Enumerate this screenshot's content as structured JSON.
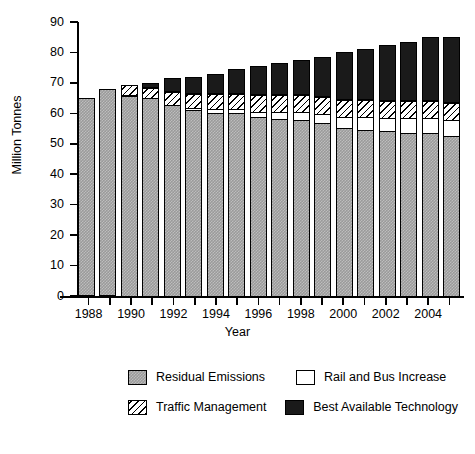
{
  "chart_data": {
    "type": "bar",
    "subtype": "stacked-bar",
    "title": "",
    "xlabel": "Year",
    "ylabel": "Million Tonnes",
    "ylim": [
      0,
      90
    ],
    "yticks": [
      0,
      10,
      20,
      30,
      40,
      50,
      60,
      70,
      80,
      90
    ],
    "ytick_labels": [
      "0",
      "10",
      "20",
      "30",
      "40",
      "50",
      "60",
      "70",
      "80",
      "90"
    ],
    "grid": false,
    "legend_position": "below-plot",
    "categories": [
      "1988",
      "1989",
      "1990",
      "1991",
      "1992",
      "1993",
      "1994",
      "1995",
      "1996",
      "1997",
      "1998",
      "1999",
      "2000",
      "2001",
      "2002",
      "2003",
      "2004",
      "2005"
    ],
    "xtick_labels": [
      "1988",
      "1990",
      "1992",
      "1994",
      "1996",
      "1998",
      "2000",
      "2002",
      "2004"
    ],
    "xtick_categories": [
      "1988",
      "1990",
      "1992",
      "1994",
      "1996",
      "1998",
      "2000",
      "2002",
      "2004"
    ],
    "series": [
      {
        "name": "Residual Emissions",
        "fill": "checkered-grey",
        "color": "#9a9a9a",
        "values": [
          65.0,
          68.0,
          66.0,
          65.5,
          63.0,
          61.5,
          60.5,
          60.5,
          59.0,
          58.5,
          58.0,
          57.0,
          55.5,
          55.0,
          54.5,
          54.0,
          54.0,
          53.0
        ]
      },
      {
        "name": "Rail and Bus Increase",
        "fill": "solid-white",
        "color": "#ffffff",
        "values": [
          0.0,
          0.0,
          0.0,
          0.0,
          0.5,
          1.0,
          1.5,
          1.5,
          2.0,
          2.5,
          3.0,
          3.5,
          4.0,
          4.5,
          4.5,
          5.0,
          5.0,
          5.5
        ]
      },
      {
        "name": "Traffic Management",
        "fill": "diagonal-hatch",
        "color": "#ffffff",
        "values": [
          0.0,
          0.0,
          3.5,
          3.5,
          4.5,
          5.0,
          5.5,
          5.5,
          6.0,
          6.0,
          6.0,
          6.0,
          6.0,
          6.0,
          6.0,
          6.0,
          6.0,
          6.0
        ]
      },
      {
        "name": "Best Available Technology",
        "fill": "solid-black",
        "color": "#1a1a1a",
        "values": [
          0.0,
          0.0,
          0.0,
          1.5,
          4.5,
          5.5,
          6.5,
          8.0,
          9.5,
          10.5,
          11.5,
          13.0,
          15.5,
          16.5,
          18.5,
          19.5,
          21.0,
          21.5
        ]
      }
    ],
    "totals": [
      65.0,
      68.0,
      69.5,
      70.5,
      72.5,
      73.0,
      74.0,
      75.5,
      76.5,
      77.5,
      78.5,
      79.5,
      81.0,
      82.0,
      83.5,
      84.5,
      86.0,
      86.0
    ]
  },
  "legend": {
    "entries": [
      {
        "label": "Residual Emissions",
        "swatch": "checkered-grey"
      },
      {
        "label": "Rail and Bus Increase",
        "swatch": "solid-white"
      },
      {
        "label": "Traffic Management",
        "swatch": "diagonal-hatch"
      },
      {
        "label": "Best Available Technology",
        "swatch": "solid-black"
      }
    ]
  },
  "colors": {
    "residual": "#9a9a9a",
    "rail": "#ffffff",
    "traffic": "#ffffff",
    "best": "#1a1a1a",
    "axis": "#000000",
    "background": "#ffffff"
  }
}
